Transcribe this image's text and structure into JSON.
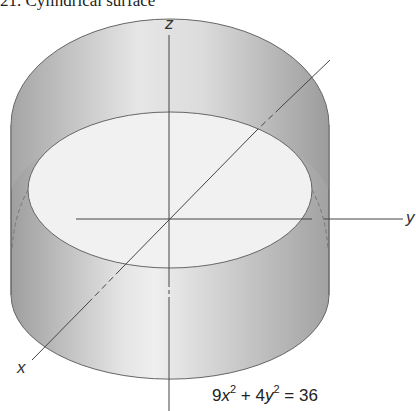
{
  "title": "21.  Cylindrical surface",
  "axes": {
    "z_label": "z",
    "y_label": "y",
    "x_label": "x"
  },
  "equation": {
    "a": "9",
    "var1": "x",
    "exp1": "2",
    "plus": " + ",
    "b": "4",
    "var2": "y",
    "exp2": "2",
    "eq": " = ",
    "rhs": "36"
  },
  "colors": {
    "surface_dark": "#a9a9a9",
    "surface_light": "#ececec",
    "inner_ellipse": "#f2f2f2",
    "stroke": "#555555"
  }
}
